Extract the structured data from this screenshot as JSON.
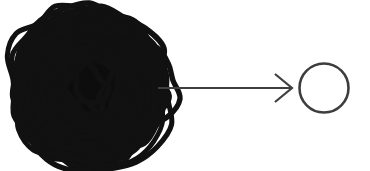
{
  "figure": {
    "title": "",
    "background_color": "#ffffff",
    "width": 370,
    "height": 171
  },
  "colors": {
    "scribble": "#111111",
    "scribble_core": "#0d0d0d",
    "arrow": "#3f3f3f",
    "circle": "#3d3d3d",
    "background": "#ffffff"
  },
  "nodes": {
    "scribble": {
      "label": "",
      "icon": "tangled-scribble-ball-icon",
      "center_x": 90,
      "center_y": 87,
      "radius_x": 78,
      "radius_y": 73,
      "stroke_width": 5,
      "loop_count": 46
    },
    "circle": {
      "label": "",
      "icon": "empty-circle-icon",
      "center_x": 324,
      "center_y": 88,
      "radius": 24.5,
      "stroke_width": 2.6
    }
  },
  "connector": {
    "label": "",
    "icon": "arrow-right-icon",
    "type": "arrow",
    "direction": "right",
    "x1": 158,
    "y1": 88,
    "x2": 292,
    "y2": 88,
    "stroke_width": 2.2,
    "head_length": 17,
    "head_spread": 14
  }
}
